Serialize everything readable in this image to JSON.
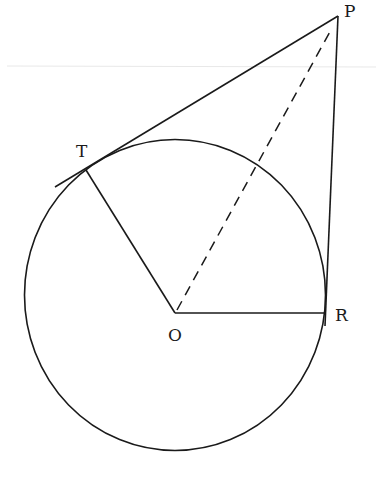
{
  "diagram": {
    "type": "geometry-circle-tangents",
    "stroke_color": "#1a1a1a",
    "artifact_line_color": "#e6e6e6",
    "points": {
      "P": {
        "label": "P",
        "x": 338,
        "y": 16
      },
      "T": {
        "label": "T",
        "x": 86,
        "y": 170
      },
      "O": {
        "label": "O",
        "x": 175,
        "y": 313
      },
      "R": {
        "label": "R",
        "x": 326,
        "y": 313
      }
    },
    "circle": {
      "cx": 175,
      "cy": 295,
      "rx": 150.5,
      "ry": 155.5
    },
    "segments": [
      {
        "name": "tangent-PT",
        "from": "P",
        "to": "T",
        "style": "solid",
        "extends_past": "T"
      },
      {
        "name": "tangent-PR",
        "from": "P",
        "to": "R",
        "style": "solid"
      },
      {
        "name": "radius-OT",
        "from": "O",
        "to": "T",
        "style": "solid"
      },
      {
        "name": "radius-OR",
        "from": "O",
        "to": "R",
        "style": "solid"
      },
      {
        "name": "line-OP",
        "from": "O",
        "to": "P",
        "style": "dashed"
      }
    ]
  }
}
